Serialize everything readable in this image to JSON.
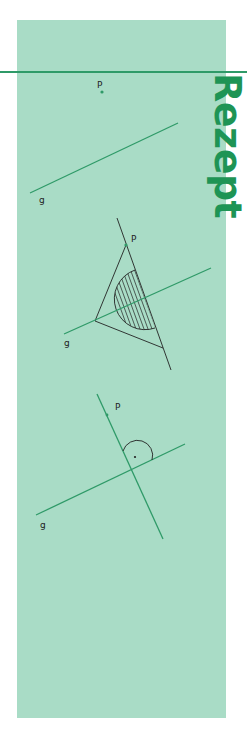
{
  "heading": {
    "text": "Rezept",
    "color": "#1e9455",
    "orientation": "vertical-rotated-90"
  },
  "colors": {
    "panel": "#a9dcc6",
    "accent_green": "#2f9a68",
    "ink": "#222222"
  },
  "figures": [
    {
      "step": 1,
      "description": "Point P and line g",
      "point_label": "P",
      "line_label": "g"
    },
    {
      "step": 2,
      "description": "Set square placed on g with one edge through P; hatched semicircle",
      "point_label": "P",
      "line_label": "g"
    },
    {
      "step": 3,
      "description": "Perpendicular through P to g with right-angle mark",
      "point_label": "P",
      "line_label": "g",
      "angle_mark": "right-angle"
    }
  ]
}
